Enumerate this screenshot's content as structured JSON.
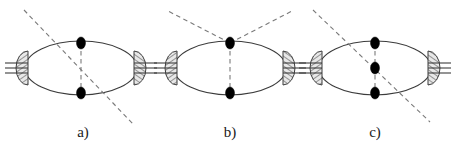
{
  "figure": {
    "title": "",
    "background_color": "#ffffff",
    "line_color": "#3c3c3c",
    "dashed_color": "#7a7a7a",
    "vertex_color": "#000000",
    "blob_fill": "#e8e8e8",
    "hatch_color": "#4a4a4a",
    "width": 458,
    "height": 151
  },
  "diagrams": [
    {
      "id": "diagram-a",
      "label": "a)",
      "label_x": 83,
      "label_y": 137,
      "ellipse": {
        "cx": 81,
        "cy": 68,
        "rx": 56,
        "ry": 27
      },
      "vertices": [
        {
          "name": "top-vertex",
          "cx": 81,
          "cy": 43,
          "rx": 4.5,
          "ry": 6
        },
        {
          "name": "bottom-vertex",
          "cx": 81,
          "cy": 93,
          "rx": 4.5,
          "ry": 6
        }
      ],
      "vertical_dashed": {
        "x1": 81,
        "y1": 43,
        "x2": 81,
        "y2": 93
      },
      "external_dashed": [
        {
          "name": "diagonal-dashed-line",
          "x1": 24,
          "y1": 10,
          "x2": 134,
          "y2": 125
        }
      ],
      "blobs": [
        {
          "name": "left-blob",
          "cx": 28,
          "cy": 68,
          "rx": 12,
          "ry": 17,
          "side": "left"
        },
        {
          "name": "right-blob",
          "cx": 134,
          "cy": 68,
          "rx": 12,
          "ry": 17,
          "side": "right"
        }
      ],
      "external_legs": {
        "left": {
          "x_from": 28,
          "x_to": 5,
          "ys": [
            63,
            68,
            73
          ]
        },
        "right": {
          "x_from": 134,
          "x_to": 157,
          "ys": [
            63,
            68,
            73
          ]
        }
      }
    },
    {
      "id": "diagram-b",
      "label": "b)",
      "label_x": 230,
      "label_y": 137,
      "ellipse": {
        "cx": 230,
        "cy": 68,
        "rx": 56,
        "ry": 27
      },
      "vertices": [
        {
          "name": "top-vertex",
          "cx": 230,
          "cy": 43,
          "rx": 4.5,
          "ry": 6
        },
        {
          "name": "bottom-vertex",
          "cx": 230,
          "cy": 93,
          "rx": 4.5,
          "ry": 6
        }
      ],
      "vertical_dashed": {
        "x1": 230,
        "y1": 43,
        "x2": 230,
        "y2": 93
      },
      "external_dashed": [
        {
          "name": "left-dashed-leg",
          "x1": 230,
          "y1": 43,
          "x2": 166,
          "y2": 10
        },
        {
          "name": "right-dashed-leg",
          "x1": 230,
          "y1": 43,
          "x2": 294,
          "y2": 10
        }
      ],
      "blobs": [
        {
          "name": "left-blob",
          "cx": 177,
          "cy": 68,
          "rx": 12,
          "ry": 17,
          "side": "left"
        },
        {
          "name": "right-blob",
          "cx": 283,
          "cy": 68,
          "rx": 12,
          "ry": 17,
          "side": "right"
        }
      ],
      "external_legs": {
        "left": {
          "x_from": 177,
          "x_to": 154,
          "ys": [
            63,
            68,
            73
          ]
        },
        "right": {
          "x_from": 283,
          "x_to": 306,
          "ys": [
            63,
            68,
            73
          ]
        }
      }
    },
    {
      "id": "diagram-c",
      "label": "c)",
      "label_x": 375,
      "label_y": 137,
      "ellipse": {
        "cx": 375,
        "cy": 68,
        "rx": 56,
        "ry": 27
      },
      "vertices": [
        {
          "name": "top-vertex",
          "cx": 375,
          "cy": 43,
          "rx": 4.5,
          "ry": 6
        },
        {
          "name": "middle-vertex",
          "cx": 375,
          "cy": 68,
          "rx": 4.5,
          "ry": 6
        },
        {
          "name": "bottom-vertex",
          "cx": 375,
          "cy": 93,
          "rx": 4.5,
          "ry": 6
        }
      ],
      "vertical_dashed": {
        "x1": 375,
        "y1": 43,
        "x2": 375,
        "y2": 93
      },
      "external_dashed": [
        {
          "name": "diagonal-dashed-line",
          "x1": 313,
          "y1": 10,
          "x2": 430,
          "y2": 122
        }
      ],
      "blobs": [
        {
          "name": "left-blob",
          "cx": 322,
          "cy": 68,
          "rx": 12,
          "ry": 17,
          "side": "left"
        },
        {
          "name": "right-blob",
          "cx": 428,
          "cy": 68,
          "rx": 12,
          "ry": 17,
          "side": "right"
        }
      ],
      "external_legs": {
        "left": {
          "x_from": 322,
          "x_to": 299,
          "ys": [
            63,
            68,
            73
          ]
        },
        "right": {
          "x_from": 428,
          "x_to": 451,
          "ys": [
            63,
            68,
            73
          ]
        }
      }
    }
  ]
}
